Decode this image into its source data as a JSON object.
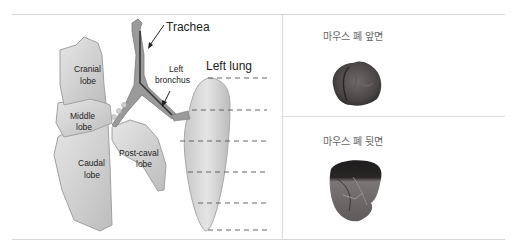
{
  "diagram": {
    "labels": {
      "trachea": "Trachea",
      "left_lung": "Left lung",
      "left_bronchus_line1": "Left",
      "left_bronchus_line2": "bronchus",
      "cranial_line1": "Cranial",
      "cranial_line2": "lobe",
      "middle_line1": "Middle",
      "middle_line2": "lobe",
      "caudal_line1": "Caudal",
      "caudal_line2": "lobe",
      "postcaval_line1": "Post-caval",
      "postcaval_line2": "lobe"
    },
    "colors": {
      "lobe_fill": "#d8d8d8",
      "lobe_stroke": "#9a9a9a",
      "trachea_fill": "#8c8c8c",
      "dashed_line": "#555555"
    }
  },
  "photos": [
    {
      "caption": "마우스 폐 앞면",
      "view": "front"
    },
    {
      "caption": "마우스 폐 뒷면",
      "view": "back"
    }
  ]
}
